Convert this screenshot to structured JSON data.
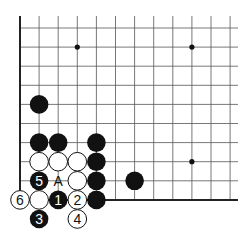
{
  "diagram": {
    "type": "go-board-fragment",
    "colors": {
      "line": "#555555",
      "edge": "#222222",
      "black": "#111111",
      "white": "#ffffff",
      "star": "#111111",
      "label_on_black": "#ffffff",
      "label_on_white": "#111111"
    },
    "grid": {
      "origin_x": 20,
      "origin_y": 28,
      "spacing": 19.1,
      "cols": 12,
      "rows": 10
    },
    "star_points": [
      [
        3,
        1
      ],
      [
        9,
        1
      ],
      [
        9,
        7
      ]
    ],
    "stones": [
      {
        "color": "black",
        "col": 1,
        "row": 4,
        "label": ""
      },
      {
        "color": "black",
        "col": 1,
        "row": 6,
        "label": ""
      },
      {
        "color": "black",
        "col": 2,
        "row": 6,
        "label": ""
      },
      {
        "color": "black",
        "col": 4,
        "row": 6,
        "label": ""
      },
      {
        "color": "white",
        "col": 1,
        "row": 7,
        "label": ""
      },
      {
        "color": "white",
        "col": 2,
        "row": 7,
        "label": ""
      },
      {
        "color": "white",
        "col": 3,
        "row": 7,
        "label": ""
      },
      {
        "color": "black",
        "col": 4,
        "row": 7,
        "label": ""
      },
      {
        "color": "black",
        "col": 1,
        "row": 8,
        "label": "5"
      },
      {
        "color": "white",
        "col": 3,
        "row": 8,
        "label": ""
      },
      {
        "color": "black",
        "col": 4,
        "row": 8,
        "label": ""
      },
      {
        "color": "black",
        "col": 6,
        "row": 8,
        "label": ""
      },
      {
        "color": "white",
        "col": 0,
        "row": 9,
        "label": "6"
      },
      {
        "color": "white",
        "col": 1,
        "row": 9,
        "label": ""
      },
      {
        "color": "black",
        "col": 2,
        "row": 9,
        "label": "1"
      },
      {
        "color": "white",
        "col": 3,
        "row": 9,
        "label": "2"
      },
      {
        "color": "black",
        "col": 4,
        "row": 9,
        "label": ""
      },
      {
        "color": "black",
        "col": 1,
        "row": 10,
        "label": "3"
      },
      {
        "color": "white",
        "col": 3,
        "row": 10,
        "label": "4"
      }
    ],
    "markers": [
      {
        "col": 2,
        "row": 8,
        "label": "A"
      }
    ]
  }
}
